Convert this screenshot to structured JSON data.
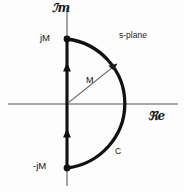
{
  "figure": {
    "background_color": "#fdfdfd",
    "width": 184,
    "height": 192
  },
  "axes": {
    "imaginary_label": "ℐm",
    "real_label": "ℜe",
    "axis_color": "#8a8a8a",
    "origin": {
      "x": 67,
      "y": 104
    }
  },
  "annotations": {
    "plane_label": "s-plane",
    "upper_point_label": "jM",
    "lower_point_label": "-jM",
    "radius_label": "M",
    "contour_label": "C"
  },
  "contour": {
    "color": "#111111",
    "radius_px": 66,
    "upper_endpoint": {
      "x": 67,
      "y": 39
    },
    "lower_endpoint": {
      "x": 67,
      "y": 168
    },
    "rightmost_point": {
      "x": 133,
      "y": 104
    },
    "direction": "counterclockwise-upward"
  }
}
